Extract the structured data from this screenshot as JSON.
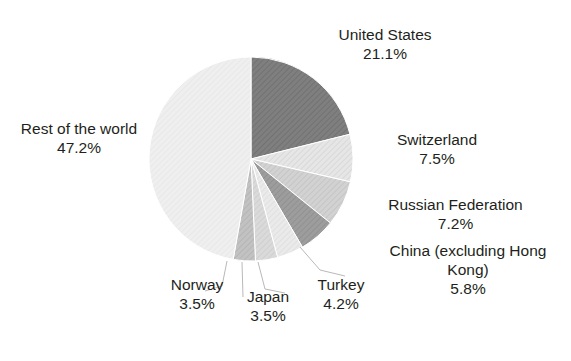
{
  "chart_data": {
    "type": "pie",
    "title": "",
    "subtitle": "",
    "xlabel": "",
    "ylabel": "",
    "legend_position": "none",
    "grid": false,
    "units": "percent",
    "start_angle_deg": 0,
    "direction": "clockwise",
    "categories": [
      "United States",
      "Switzerland",
      "Russian Federation",
      "China (excluding Hong Kong)",
      "Turkey",
      "Japan",
      "Norway",
      "Rest of the world"
    ],
    "values": [
      21.1,
      7.5,
      7.2,
      5.8,
      4.2,
      3.5,
      3.5,
      47.2
    ],
    "slices": [
      {
        "name": "United States",
        "label_lines": [
          "United States"
        ],
        "value": 21.1,
        "value_text": "21.1%",
        "color": "#7f7f7f",
        "pattern": "diagonal-hatch"
      },
      {
        "name": "Switzerland",
        "label_lines": [
          "Switzerland"
        ],
        "value": 7.5,
        "value_text": "7.5%",
        "color": "#e3e3e3",
        "pattern": "diagonal-hatch"
      },
      {
        "name": "Russian Federation",
        "label_lines": [
          "Russian Federation"
        ],
        "value": 7.2,
        "value_text": "7.2%",
        "color": "#cfcfcf",
        "pattern": "diagonal-hatch"
      },
      {
        "name": "China (excluding Hong Kong)",
        "label_lines": [
          "China (excluding Hong",
          "Kong)"
        ],
        "value": 5.8,
        "value_text": "5.8%",
        "color": "#9a9a9a",
        "pattern": "diagonal-hatch"
      },
      {
        "name": "Turkey",
        "label_lines": [
          "Turkey"
        ],
        "value": 4.2,
        "value_text": "4.2%",
        "color": "#e8e8e8",
        "pattern": "diagonal-hatch"
      },
      {
        "name": "Japan",
        "label_lines": [
          "Japan"
        ],
        "value": 3.5,
        "value_text": "3.5%",
        "color": "#d8d8d8",
        "pattern": "diagonal-hatch"
      },
      {
        "name": "Norway",
        "label_lines": [
          "Norway"
        ],
        "value": 3.5,
        "value_text": "3.5%",
        "color": "#bdbdbd",
        "pattern": "diagonal-hatch"
      },
      {
        "name": "Rest of the world",
        "label_lines": [
          "Rest of the world"
        ],
        "value": 47.2,
        "value_text": "47.2%",
        "color": "#eeeeee",
        "pattern": "diagonal-hatch"
      }
    ]
  },
  "labels": {
    "united_states": {
      "name": "United States",
      "pct": "21.1%"
    },
    "switzerland": {
      "name": "Switzerland",
      "pct": "7.5%"
    },
    "russian_federation": {
      "name": "Russian Federation",
      "pct": "7.2%"
    },
    "china": {
      "name_line1": "China (excluding Hong",
      "name_line2": "Kong)",
      "pct": "5.8%"
    },
    "turkey": {
      "name": "Turkey",
      "pct": "4.2%"
    },
    "japan": {
      "name": "Japan",
      "pct": "3.5%"
    },
    "norway": {
      "name": "Norway",
      "pct": "3.5%"
    },
    "rest_of_world": {
      "name": "Rest of the world",
      "pct": "47.2%"
    }
  },
  "colors": {
    "background": "#ffffff",
    "text": "#231f20",
    "leader_line": "#b9b9b9",
    "slice_outline": "#ffffff"
  }
}
